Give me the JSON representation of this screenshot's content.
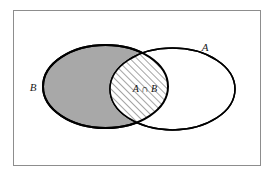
{
  "figure": {
    "kind": "venn-diagram",
    "title": "",
    "background_color": "#ffffff",
    "frame": {
      "name": "outer-frame",
      "x": 13,
      "y": 10,
      "width": 247,
      "height": 155,
      "stroke_color": "#8d8d8d",
      "stroke_width": 1,
      "fill": "#ffffff"
    },
    "sets": [
      {
        "id": "B",
        "label": "B",
        "label_x": 33,
        "label_y": 91,
        "fill_color": "#a8a8a8",
        "stroke_color": "#000000",
        "stroke_width": 2,
        "cx": 105.5,
        "cy": 86.5,
        "rx": 62.5,
        "ry": 41.5
      },
      {
        "id": "A",
        "label": "A",
        "label_x": 205,
        "label_y": 51,
        "fill_color": "#ffffff",
        "stroke_color": "#000000",
        "stroke_width": 1.5,
        "cx": 172.5,
        "cy": 89,
        "rx": 62.5,
        "ry": 41
      }
    ],
    "intersection": {
      "id": "A-cap-B",
      "label": "A ∩ B",
      "label_x": 145,
      "label_y": 92,
      "fill_color": "#ffffff",
      "hatch_color": "#4a4a4a",
      "hatch_angle_deg": 45,
      "hatch_spacing": 5,
      "hatch_stroke_width": 1
    }
  }
}
